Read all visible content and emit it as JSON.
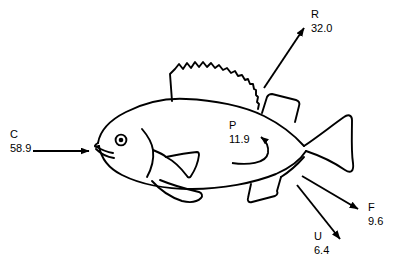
{
  "diagram": {
    "stroke_color": "#000000",
    "background_color": "#ffffff",
    "flows": [
      {
        "id": "consumption",
        "symbol": "C",
        "value": "58.9",
        "arrow": "straight-right",
        "direction": "into-mouth"
      },
      {
        "id": "respiration",
        "symbol": "R",
        "value": "32.0",
        "arrow": "straight-up-right",
        "direction": "out-of-body"
      },
      {
        "id": "production",
        "symbol": "P",
        "value": "11.9",
        "arrow": "curved-hook-up-left",
        "direction": "internal"
      },
      {
        "id": "feces",
        "symbol": "F",
        "value": "9.6",
        "arrow": "straight-down-right",
        "direction": "out-of-body"
      },
      {
        "id": "excretion",
        "symbol": "U",
        "value": "6.4",
        "arrow": "straight-down-right-steep",
        "direction": "out-of-body"
      }
    ],
    "fish_parts": [
      "body-outline",
      "head-line",
      "mouth",
      "eye",
      "gill-cover",
      "spiny-dorsal-fin",
      "soft-dorsal-fin",
      "pectoral-fin",
      "pelvic-fin",
      "anal-fin",
      "caudal-fin"
    ]
  }
}
